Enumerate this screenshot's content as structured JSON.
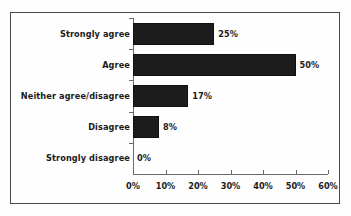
{
  "chart_data": {
    "type": "bar",
    "orientation": "horizontal",
    "title": "",
    "subtitle": "",
    "xlabel": "",
    "ylabel": "",
    "categories": [
      "Strongly agree",
      "Agree",
      "Neither agree/disagree",
      "Disagree",
      "Strongly disagree"
    ],
    "values": [
      25,
      50,
      17,
      8,
      0
    ],
    "data_labels": [
      "25%",
      "50%",
      "17%",
      "8%",
      "0%"
    ],
    "xlim": [
      0,
      60
    ],
    "xticks": [
      0,
      10,
      20,
      30,
      40,
      50,
      60
    ],
    "xtick_labels": [
      "0%",
      "10%",
      "20%",
      "30%",
      "40%",
      "50%",
      "60%"
    ],
    "grid": false,
    "legend": false,
    "bar_color": "#1c1c1c",
    "axis_color": "#6b6b6b",
    "border_color": "#4a4a4a",
    "background_color": "#fefefe"
  }
}
